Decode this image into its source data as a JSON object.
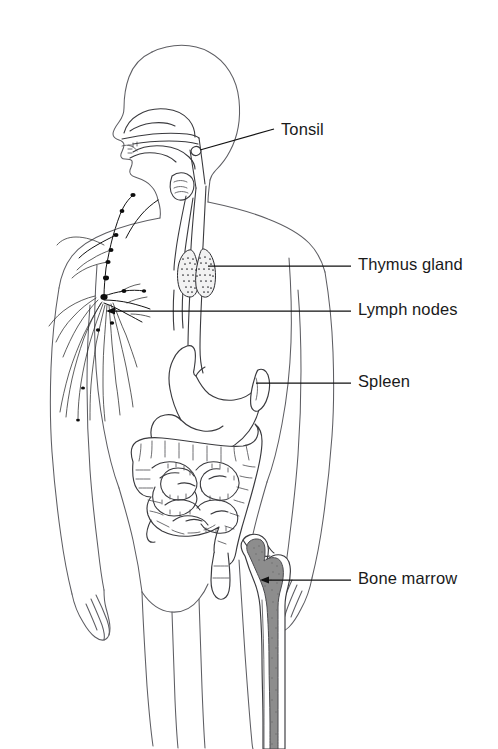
{
  "figure": {
    "view": "anterior whole-body outline with head in left profile",
    "background_color": "#ffffff",
    "line_color": "#3a3a3e",
    "body_outline_color": "#5e5e63",
    "label_color": "#1a1a1a",
    "marrow_color": "#8d8d8d",
    "node_color": "#0d0d0d"
  },
  "labels": [
    {
      "id": "tonsil",
      "text": "Tonsil",
      "x": 281,
      "y": 121,
      "leader": {
        "from_x": 200,
        "from_y": 150,
        "to_x": 274,
        "to_y": 129,
        "style": "diagonal"
      }
    },
    {
      "id": "thymus-gland",
      "text": "Thymus gland",
      "x": 358,
      "y": 256,
      "leader": {
        "from_x": 208,
        "from_y": 266,
        "to_x": 351,
        "to_y": 266,
        "style": "horizontal"
      }
    },
    {
      "id": "lymph-nodes",
      "text": "Lymph nodes",
      "x": 358,
      "y": 301,
      "leader": {
        "from_x": 108,
        "from_y": 311,
        "to_x": 351,
        "to_y": 311,
        "style": "horizontal-arrow"
      }
    },
    {
      "id": "spleen",
      "text": "Spleen",
      "x": 358,
      "y": 373,
      "leader": {
        "from_x": 256,
        "from_y": 383,
        "to_x": 351,
        "to_y": 383,
        "style": "horizontal"
      }
    },
    {
      "id": "bone-marrow",
      "text": "Bone marrow",
      "x": 358,
      "y": 570,
      "leader": {
        "from_x": 262,
        "from_y": 580,
        "to_x": 351,
        "to_y": 580,
        "style": "horizontal-arrow"
      }
    }
  ],
  "structures": [
    {
      "id": "body",
      "name": "human body outline"
    },
    {
      "id": "head",
      "name": "head in profile with nasal cavity, tongue and pharynx"
    },
    {
      "id": "tonsil",
      "name": "tonsil in pharynx"
    },
    {
      "id": "trachea-esophagus",
      "name": "trachea and esophagus"
    },
    {
      "id": "thymus",
      "name": "bilobed thymus gland"
    },
    {
      "id": "lymph-network",
      "name": "lymphatic vessels and axillary lymph nodes"
    },
    {
      "id": "stomach",
      "name": "stomach"
    },
    {
      "id": "spleen",
      "name": "spleen"
    },
    {
      "id": "large-intestine",
      "name": "large intestine / colon"
    },
    {
      "id": "small-intestine",
      "name": "small intestine coils"
    },
    {
      "id": "femur",
      "name": "femur with red bone marrow cavity"
    }
  ]
}
